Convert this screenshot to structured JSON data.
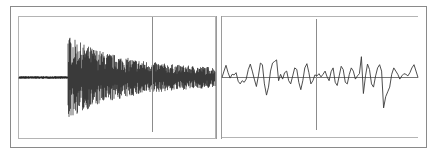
{
  "figure": {
    "colors": {
      "background": "#ffffff",
      "frame": "#8a8a8a",
      "inner_border": "#b4b4b4",
      "waveform_dense": "#1e1e1e",
      "waveform_detail": "#3a3a3a",
      "baseline": "#555555",
      "cursor": "#8c8c8c"
    }
  },
  "left_panel": {
    "name": "overview-waveform",
    "baseline_level": 0,
    "onset_fraction": 0.25,
    "cursor_fraction": 0.68,
    "pre_onset_amplitude": 0.03,
    "peak_amplitude": 0.95,
    "decay_end_amplitude": 0.18
  },
  "right_panel": {
    "name": "detail-waveform",
    "cursor_fraction": 0.48,
    "samples": [
      0,
      0.2,
      0.38,
      0.15,
      -0.02,
      0.1,
      0.08,
      0.15,
      -0.12,
      -0.2,
      -0.1,
      -0.15,
      -0.05,
      0.25,
      0.42,
      0.2,
      -0.05,
      -0.28,
      0.05,
      0.45,
      0.4,
      -0.2,
      -0.55,
      -0.3,
      0.2,
      0.45,
      0.5,
      0.55,
      -0.1,
      0.1,
      -0.05,
      0.15,
      0.2,
      -0.1,
      -0.2,
      0.05,
      0.3,
      0.25,
      -0.15,
      -0.38,
      -0.1,
      0.3,
      0.43,
      0.15,
      -0.2,
      -0.1,
      0.08,
      0.05,
      0.12,
      0.02,
      0.1,
      0.2,
      0.02,
      -0.1,
      0.18,
      0.3,
      -0.15,
      -0.25,
      0.05,
      0.35,
      0.25,
      -0.15,
      -0.2,
      0.1,
      0.3,
      0.2,
      -0.05,
      0.05,
      0.12,
      0.65,
      -0.5,
      0.05,
      0.42,
      0.25,
      -0.2,
      -0.3,
      0.05,
      0.3,
      0.4,
      0.2,
      -0.95,
      -0.6,
      -0.45,
      -0.3,
      0.1,
      0.3,
      0.2,
      0.1,
      -0.05,
      0.05,
      0.12,
      0.1,
      0.05,
      0.15,
      0.3,
      0.4,
      0.2,
      0.0
    ]
  }
}
